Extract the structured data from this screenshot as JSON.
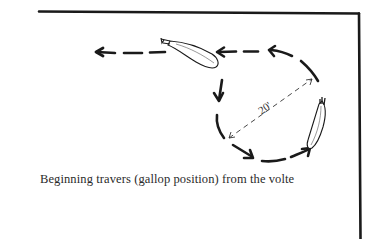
{
  "figure": {
    "caption": "Beginning travers (gallop position) from the volte",
    "dimension_label": "20'",
    "colors": {
      "ink": "#1a1a1a",
      "background": "#ffffff",
      "caption_text": "#2a2a2a"
    },
    "elements": {
      "arena_wall": "top and right boundary lines",
      "horse_top": "horse viewed from above, heading left along the track",
      "horse_right": "horse viewed from above, heading up on the volte",
      "volte_path": "dashed circular path with direction arrows",
      "exit_path": "dashed straight path with arrow pointing left",
      "diameter": "thin dashed double-headed arrow indicating 20 ft diameter"
    }
  }
}
